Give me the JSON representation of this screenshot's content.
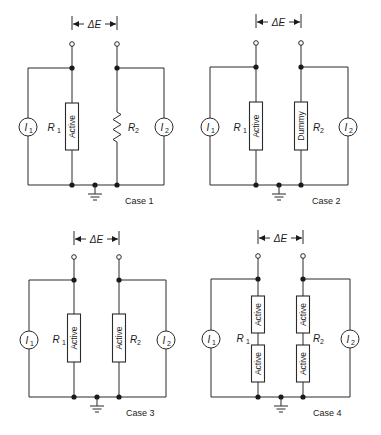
{
  "figure": {
    "voltage_label": "ΔE",
    "source_left": {
      "symbol": "I",
      "subscript": "1"
    },
    "source_right": {
      "symbol": "I",
      "subscript": "2"
    },
    "resistor_left": {
      "symbol": "R",
      "subscript": "1"
    },
    "resistor_right": {
      "symbol": "R",
      "subscript": "2"
    }
  },
  "cases": [
    {
      "label": "Case 1",
      "r1_elements": [
        "Active"
      ],
      "r2_type": "resistor",
      "r2_elements": []
    },
    {
      "label": "Case 2",
      "r1_elements": [
        "Active"
      ],
      "r2_type": "box",
      "r2_elements": [
        "Dummy"
      ]
    },
    {
      "label": "Case 3",
      "r1_elements": [
        "Active"
      ],
      "r2_type": "box",
      "r2_elements": [
        "Active"
      ]
    },
    {
      "label": "Case 4",
      "r1_elements": [
        "Active",
        "Active"
      ],
      "r2_type": "box",
      "r2_elements": [
        "Active",
        "Active"
      ]
    }
  ],
  "colors": {
    "line": "#2a2a2a",
    "background": "#ffffff"
  }
}
